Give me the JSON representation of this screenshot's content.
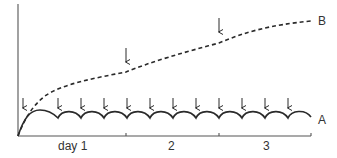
{
  "chart_data": {
    "type": "line",
    "title": "",
    "xlabel": "",
    "ylabel": "",
    "x_tick_labels": [
      "day 1",
      "2",
      "3"
    ],
    "x_ticks_px": [
      18,
      126,
      219,
      311
    ],
    "grid": false,
    "legend": "inline curve labels at right",
    "series": [
      {
        "name": "A",
        "style": "solid",
        "description": "scalloped plateau: rises from origin then repeated arcs with cusps at each dose arrow",
        "dose_arrows_x": [
          23,
          58,
          81,
          104,
          127,
          150,
          173,
          196,
          219,
          242,
          265,
          288
        ],
        "cusp_y": 118,
        "peak_y": 111
      },
      {
        "name": "B",
        "style": "dashed",
        "description": "cumulative rise with kinks at each dose arrow",
        "points": [
          [
            18,
            136
          ],
          [
            30,
            110
          ],
          [
            50,
            93
          ],
          [
            80,
            82
          ],
          [
            126,
            72
          ],
          [
            170,
            56
          ],
          [
            219,
            43
          ],
          [
            260,
            30
          ],
          [
            311,
            21
          ]
        ],
        "dose_arrows_x": [
          126,
          219
        ]
      }
    ],
    "colors": {
      "line": "#2a2a2a",
      "axis": "#555555",
      "text": "#333333"
    }
  },
  "labels": {
    "series_a": "A",
    "series_b": "B",
    "day1": "day 1",
    "day2": "2",
    "day3": "3"
  }
}
